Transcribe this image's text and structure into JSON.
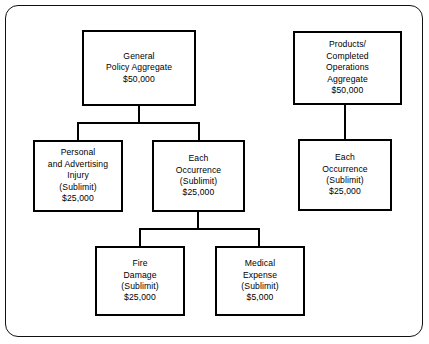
{
  "diagram": {
    "type": "hierarchy-tree",
    "nodes": [
      {
        "id": "general-policy-aggregate",
        "name": "general-policy-aggregate-box",
        "lines": [
          "General",
          "Policy Aggregate",
          "$50,000"
        ],
        "x": 82,
        "y": 30,
        "w": 114,
        "h": 76
      },
      {
        "id": "products-completed-operations-aggregate",
        "name": "products-completed-operations-aggregate-box",
        "lines": [
          "Products/",
          "Completed",
          "Operations",
          "Aggregate",
          "$50,000"
        ],
        "x": 293,
        "y": 31,
        "w": 109,
        "h": 74
      },
      {
        "id": "personal-and-advertising-injury",
        "name": "personal-and-advertising-injury-box",
        "lines": [
          "Personal",
          "and Advertising",
          "Injury",
          "(Sublimit)",
          "$25,000"
        ],
        "x": 33,
        "y": 140,
        "w": 90,
        "h": 72
      },
      {
        "id": "each-occurrence-general",
        "name": "each-occurrence-general-box",
        "lines": [
          "Each",
          "Occurrence",
          "(Sublimit)",
          "$25,000"
        ],
        "x": 152,
        "y": 140,
        "w": 93,
        "h": 72
      },
      {
        "id": "each-occurrence-products",
        "name": "each-occurrence-products-box",
        "lines": [
          "Each",
          "Occurrence",
          "(Sublimit)",
          "$25,000"
        ],
        "x": 298,
        "y": 139,
        "w": 94,
        "h": 72
      },
      {
        "id": "fire-damage",
        "name": "fire-damage-box",
        "lines": [
          "Fire",
          "Damage",
          "(Sublimit)",
          "$25,000"
        ],
        "x": 95,
        "y": 246,
        "w": 90,
        "h": 70
      },
      {
        "id": "medical-expense",
        "name": "medical-expense-box",
        "lines": [
          "Medical",
          "Expense",
          "(Sublimit)",
          "$5,000"
        ],
        "x": 215,
        "y": 246,
        "w": 90,
        "h": 70
      }
    ],
    "connectors": [
      {
        "name": "connector-general-stem",
        "orient": "v",
        "x": 138,
        "y": 106,
        "len": 17
      },
      {
        "name": "connector-general-bar",
        "orient": "h",
        "x": 77,
        "y": 122,
        "len": 123
      },
      {
        "name": "connector-general-to-personal",
        "orient": "v",
        "x": 77,
        "y": 122,
        "len": 18
      },
      {
        "name": "connector-general-to-each",
        "orient": "v",
        "x": 198,
        "y": 122,
        "len": 18
      },
      {
        "name": "connector-each-stem",
        "orient": "v",
        "x": 197,
        "y": 212,
        "len": 18
      },
      {
        "name": "connector-each-bar",
        "orient": "h",
        "x": 139,
        "y": 228,
        "len": 121
      },
      {
        "name": "connector-each-to-fire",
        "orient": "v",
        "x": 139,
        "y": 228,
        "len": 18
      },
      {
        "name": "connector-each-to-medical",
        "orient": "v",
        "x": 258,
        "y": 228,
        "len": 18
      },
      {
        "name": "connector-products-to-each",
        "orient": "v",
        "x": 344,
        "y": 105,
        "len": 35
      }
    ]
  }
}
